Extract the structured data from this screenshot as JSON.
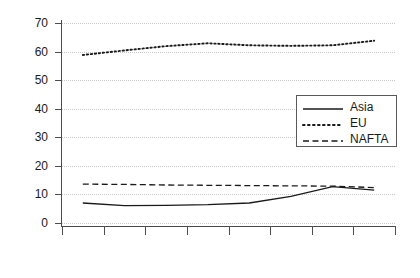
{
  "chart_data": {
    "type": "line",
    "title": "",
    "xlabel": "",
    "ylabel": "",
    "x": [
      "2001",
      "2002",
      "2003",
      "2004",
      "2005",
      "2006",
      "2007",
      "2008"
    ],
    "categories": [
      "2001",
      "2002",
      "2003",
      "2004",
      "2005",
      "2006",
      "2007",
      "2008"
    ],
    "series": [
      {
        "name": "Asia",
        "style": "solid",
        "values": [
          7.0,
          6.1,
          6.2,
          6.4,
          7.0,
          9.3,
          12.7,
          11.5
        ]
      },
      {
        "name": "EU",
        "style": "dotted",
        "values": [
          58.8,
          60.4,
          61.9,
          62.9,
          62.2,
          62.0,
          62.2,
          63.8
        ]
      },
      {
        "name": "NAFTA",
        "style": "dashed",
        "values": [
          13.6,
          13.5,
          13.3,
          13.2,
          13.1,
          13.0,
          12.9,
          12.4
        ]
      }
    ],
    "ylim": [
      0,
      70
    ],
    "yticks": [
      0,
      10,
      20,
      30,
      40,
      50,
      60,
      70
    ],
    "ytick_labels": [
      "0",
      "10",
      "20",
      "30",
      "40",
      "50",
      "60",
      "70"
    ],
    "grid": true,
    "grid_style": "dotted-horizontal",
    "legend_position": "center-right",
    "legend_entries": [
      "Asia",
      "EU",
      "NAFTA"
    ],
    "xtick_label_rotation": 90,
    "colors": {
      "series": "#1a1a1a",
      "axis": "#4d4d4d",
      "grid": "#c9c9c9",
      "background": "#ffffff",
      "text": "#1a1a1a",
      "legend_border": "#5a5a5a"
    }
  }
}
